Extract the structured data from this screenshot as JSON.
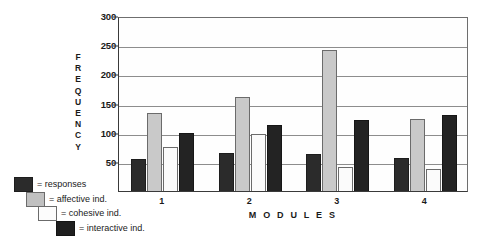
{
  "chart_data": {
    "type": "bar",
    "title": "",
    "xlabel": "M O D U L E S",
    "ylabel": "FREQUENCY",
    "categories": [
      "1",
      "2",
      "3",
      "4"
    ],
    "ylim": [
      0,
      300
    ],
    "yticks": [
      0,
      50,
      100,
      150,
      200,
      250,
      300
    ],
    "ytick_labels": [
      "",
      "50",
      "100",
      "150",
      "200",
      "250",
      "300"
    ],
    "grid": true,
    "legend_position": "bottom-left",
    "series": [
      {
        "name": "responses",
        "color": "#2b2b2b",
        "values": [
          55,
          65,
          63,
          57
        ]
      },
      {
        "name": "affective ind.",
        "color": "#c9c9c9",
        "values": [
          133,
          162,
          242,
          123
        ]
      },
      {
        "name": "cohesive ind.",
        "color": "#fbfbfb",
        "values": [
          75,
          97,
          42,
          38
        ]
      },
      {
        "name": "interactive ind.",
        "color": "#232323",
        "values": [
          99,
          113,
          122,
          130
        ]
      }
    ]
  },
  "axes": {
    "y_title_letters": [
      "F",
      "R",
      "E",
      "Q",
      "U",
      "E",
      "N",
      "C",
      "Y"
    ],
    "x_title": "M O D U L E S"
  },
  "legend": {
    "items": [
      {
        "label": "= responses",
        "series": "responses"
      },
      {
        "label": "= affective ind.",
        "series": "affective ind."
      },
      {
        "label": "= cohesive ind.",
        "series": "cohesive ind."
      },
      {
        "label": "= interactive ind.",
        "series": "interactive ind."
      }
    ]
  }
}
